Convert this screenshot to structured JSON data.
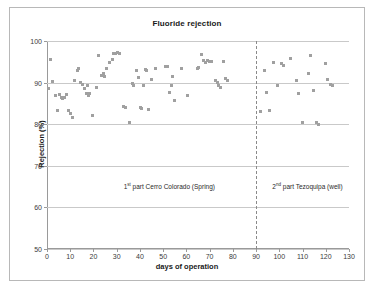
{
  "chart_data": {
    "type": "scatter",
    "title": "Fluoride rejection",
    "xlabel": "days of operation",
    "ylabel": "Rejection (%)",
    "xlim": [
      0,
      130
    ],
    "ylim": [
      50,
      100
    ],
    "xticks": [
      0,
      10,
      20,
      30,
      40,
      50,
      60,
      70,
      80,
      90,
      100,
      110,
      120,
      130
    ],
    "yticks": [
      50,
      60,
      70,
      80,
      90,
      100
    ],
    "grid": "horizontal",
    "legend": "none",
    "marker_color": "#a0a0a0",
    "marker_shape": "square",
    "divider_x": 90,
    "annotations": [
      {
        "text_prefix": "1",
        "text_sup": "st",
        "text_rest": " part Cerro Colorado (Spring)",
        "x": 33,
        "y": 66
      },
      {
        "text_prefix": "2",
        "text_sup": "nd",
        "text_rest": " part Tezoquipa  (well)",
        "x": 97,
        "y": 66
      }
    ],
    "series": [
      {
        "name": "1st part Cerro Colorado (Spring)",
        "points": [
          [
            0.6,
            88.6
          ],
          [
            1.6,
            95.6
          ],
          [
            2.4,
            90.3
          ],
          [
            3.6,
            86.9
          ],
          [
            4.4,
            83.2
          ],
          [
            5.4,
            87.1
          ],
          [
            6.2,
            86.3
          ],
          [
            6.8,
            86.2
          ],
          [
            7.6,
            86.4
          ],
          [
            8.4,
            87.1
          ],
          [
            9.4,
            83.3
          ],
          [
            10.2,
            82.5
          ],
          [
            10.8,
            81.6
          ],
          [
            12.0,
            90.5
          ],
          [
            13.0,
            92.9
          ],
          [
            13.6,
            93.4
          ],
          [
            14.6,
            90.0
          ],
          [
            15.4,
            89.5
          ],
          [
            16.2,
            88.7
          ],
          [
            16.8,
            87.3
          ],
          [
            17.4,
            89.2
          ],
          [
            17.8,
            86.9
          ],
          [
            18.4,
            87.5
          ],
          [
            19.4,
            82.1
          ],
          [
            21.2,
            88.8
          ],
          [
            22.0,
            96.6
          ],
          [
            23.6,
            91.8
          ],
          [
            24.2,
            92.1
          ],
          [
            24.8,
            91.4
          ],
          [
            25.6,
            93.3
          ],
          [
            27.0,
            94.9
          ],
          [
            28.0,
            95.6
          ],
          [
            28.8,
            96.9
          ],
          [
            29.6,
            97.0
          ],
          [
            30.4,
            97.3
          ],
          [
            31.0,
            97.1
          ],
          [
            33.0,
            84.3
          ],
          [
            34.0,
            84.0
          ],
          [
            35.6,
            80.3
          ],
          [
            36.6,
            89.8
          ],
          [
            37.4,
            89.4
          ],
          [
            38.4,
            92.8
          ],
          [
            39.2,
            91.2
          ],
          [
            40.2,
            84.0
          ],
          [
            40.8,
            83.7
          ],
          [
            41.6,
            89.3
          ],
          [
            42.4,
            93.1
          ],
          [
            43.0,
            93.0
          ],
          [
            43.8,
            83.6
          ],
          [
            45.0,
            90.8
          ],
          [
            46.6,
            93.5
          ],
          [
            51.0,
            93.9
          ],
          [
            51.8,
            93.9
          ],
          [
            52.6,
            87.7
          ],
          [
            53.4,
            89.4
          ],
          [
            54.2,
            91.4
          ],
          [
            55.0,
            85.8
          ],
          [
            58.0,
            93.3
          ],
          [
            60.4,
            86.8
          ],
          [
            64.6,
            93.3
          ],
          [
            65.4,
            93.6
          ],
          [
            66.6,
            96.7
          ],
          [
            67.4,
            95.3
          ],
          [
            68.2,
            94.9
          ],
          [
            69.0,
            95.2
          ],
          [
            69.8,
            95.0
          ],
          [
            70.6,
            95.1
          ],
          [
            72.4,
            90.4
          ],
          [
            73.2,
            90.0
          ],
          [
            74.0,
            89.3
          ],
          [
            74.8,
            88.9
          ],
          [
            76.0,
            95.0
          ],
          [
            77.0,
            91.1
          ],
          [
            77.8,
            90.6
          ]
        ]
      },
      {
        "name": "2nd part Tezoquipa (well)",
        "points": [
          [
            92.0,
            83.0
          ],
          [
            93.6,
            92.8
          ],
          [
            94.4,
            87.7
          ],
          [
            95.6,
            83.2
          ],
          [
            97.6,
            94.8
          ],
          [
            99.4,
            89.4
          ],
          [
            101.0,
            94.5
          ],
          [
            102.0,
            94.2
          ],
          [
            105.0,
            95.9
          ],
          [
            107.2,
            90.4
          ],
          [
            108.4,
            87.4
          ],
          [
            110.0,
            80.5
          ],
          [
            112.6,
            92.1
          ],
          [
            113.6,
            96.6
          ],
          [
            114.6,
            88.2
          ],
          [
            116.0,
            80.4
          ],
          [
            117.0,
            80.0
          ],
          [
            119.8,
            94.5
          ],
          [
            120.6,
            90.7
          ],
          [
            122.0,
            89.5
          ],
          [
            122.8,
            89.4
          ]
        ]
      }
    ]
  }
}
